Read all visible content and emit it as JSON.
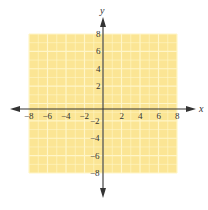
{
  "chart_data": {
    "type": "scatter",
    "title": "",
    "xlabel": "x",
    "ylabel": "y",
    "xlim": [
      -8,
      8
    ],
    "ylim": [
      -8,
      8
    ],
    "grid": true,
    "grid_step": 1,
    "series": [],
    "x_ticks": [
      "−8",
      "−6",
      "−4",
      "−2",
      "2",
      "4",
      "6",
      "8"
    ],
    "y_ticks": [
      "8",
      "6",
      "4",
      "2",
      "−2",
      "−4",
      "−6",
      "−8"
    ],
    "x_tick_values": [
      -8,
      -6,
      -4,
      -2,
      2,
      4,
      6,
      8
    ],
    "y_tick_values": [
      8,
      6,
      4,
      2,
      -2,
      -4,
      -6,
      -8
    ]
  },
  "colors": {
    "grid_fill": "#fbe594",
    "grid_line": "#fff6c8",
    "axis": "#333333"
  },
  "axes": {
    "x_label": "x",
    "y_label": "y"
  }
}
